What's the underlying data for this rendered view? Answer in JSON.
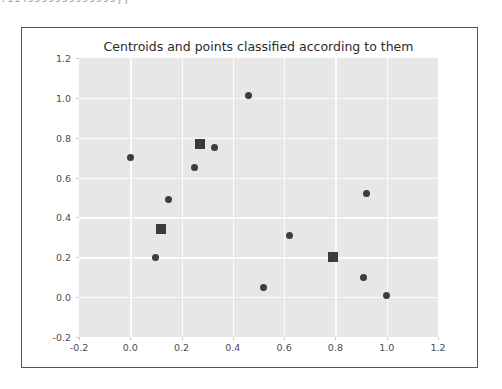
{
  "console_sliver": {
    "text": ".1149999999999999]]"
  },
  "chart_data": {
    "type": "scatter",
    "title": "Centroids and points classified according to them",
    "xlabel": "",
    "ylabel": "",
    "xlim": [
      -0.2,
      1.2
    ],
    "ylim": [
      -0.2,
      1.2
    ],
    "grid": true,
    "legend": "none",
    "plot_background": "#e7e7e7",
    "marker_color": "#3c3c3c",
    "xticks": [
      "-0.2",
      "0.0",
      "0.2",
      "0.4",
      "0.6",
      "0.8",
      "1.0",
      "1.2"
    ],
    "xtick_values": [
      -0.2,
      0.0,
      0.2,
      0.4,
      0.6,
      0.8,
      1.0,
      1.2
    ],
    "yticks": [
      "-0.2",
      "0.0",
      "0.2",
      "0.4",
      "0.6",
      "0.8",
      "1.0",
      "1.2"
    ],
    "ytick_values": [
      -0.2,
      0.0,
      0.2,
      0.4,
      0.6,
      0.8,
      1.0,
      1.2
    ],
    "series": [
      {
        "name": "points",
        "marker": "circle",
        "points": [
          [
            0.0,
            0.7
          ],
          [
            0.15,
            0.49
          ],
          [
            0.25,
            0.65
          ],
          [
            0.33,
            0.75
          ],
          [
            0.46,
            1.01
          ],
          [
            0.1,
            0.2
          ],
          [
            0.62,
            0.31
          ],
          [
            0.52,
            0.05
          ],
          [
            0.92,
            0.52
          ],
          [
            0.91,
            0.1
          ],
          [
            1.0,
            0.01
          ]
        ]
      },
      {
        "name": "centroids",
        "marker": "square",
        "points": [
          [
            0.27,
            0.77
          ],
          [
            0.12,
            0.34
          ],
          [
            0.79,
            0.2
          ]
        ]
      }
    ]
  }
}
